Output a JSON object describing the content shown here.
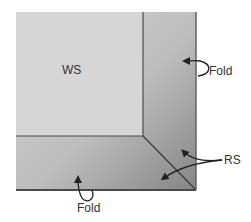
{
  "diagram": {
    "labels": {
      "wrong_side": "WS",
      "right_side": "RS",
      "fold_right": "Fold",
      "fold_bottom": "Fold"
    },
    "colors": {
      "wrong_side_fill": "#d6d6d6",
      "right_side_light": "#cfcfcf",
      "right_side_dark": "#8c8c8c",
      "edge_line": "#4a4a4a",
      "arrow": "#222222",
      "text": "#333333"
    }
  }
}
